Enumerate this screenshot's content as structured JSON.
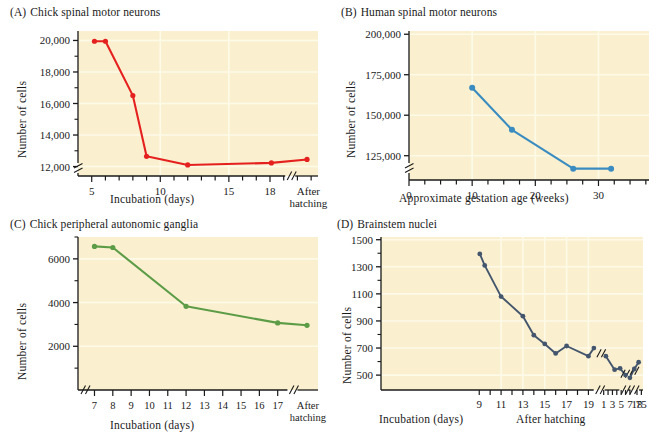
{
  "figure": {
    "background": "#ffffff",
    "plot_background": "#faf0cf",
    "grid_color": "#fdfae8",
    "axis_color": "#1a1a1a"
  },
  "chart_data": [
    {
      "id": "A",
      "type": "line",
      "tag": "(A)",
      "title": "Chick spinal motor neurons",
      "xlabel": "Incubation (days)",
      "ylabel": "Number of cells",
      "color": "#e5211f",
      "grid": true,
      "legend": "none",
      "axis_break_y": true,
      "axis_break_x": true,
      "xlim": [
        4,
        21.5
      ],
      "ylim": [
        11400,
        20600
      ],
      "xticks": [
        5,
        6,
        7,
        8,
        9,
        10,
        11,
        12,
        13,
        14,
        15,
        16,
        17,
        18,
        19,
        20,
        21
      ],
      "xticklabels": [
        "5",
        "",
        "",
        "",
        "",
        "10",
        "",
        "",
        "",
        "",
        "15",
        "",
        "",
        "18",
        "",
        "",
        ""
      ],
      "x_end_label": [
        "After",
        "hatching"
      ],
      "yticks": [
        12000,
        14000,
        16000,
        18000,
        20000
      ],
      "yticklabels": [
        "12,000",
        "14,000",
        "16,000",
        "18,000",
        "20,000"
      ],
      "x": [
        5.2,
        6.0,
        8.0,
        9.0,
        12.0,
        18.1,
        20.7
      ],
      "y": [
        19950,
        19950,
        16500,
        12650,
        12100,
        12230,
        12450
      ]
    },
    {
      "id": "B",
      "type": "line",
      "tag": "(B)",
      "title": "Human spinal motor neurons",
      "xlabel": "Approximate gestation age (weeks)",
      "ylabel": "Number of cells",
      "color": "#3a8cc0",
      "grid": true,
      "legend": "none",
      "axis_break_y": true,
      "axis_break_x": false,
      "xlim": [
        0,
        38
      ],
      "ylim": [
        110000,
        202000
      ],
      "xticks": [
        0,
        2.5,
        5,
        7.5,
        10,
        12.5,
        15,
        17.5,
        20,
        22.5,
        25,
        27.5,
        30,
        32.5,
        35,
        37.5
      ],
      "xticklabels": [
        "0",
        "",
        "",
        "",
        "10",
        "",
        "",
        "",
        "20",
        "",
        "",
        "",
        "30",
        "",
        "",
        ""
      ],
      "yticks": [
        125000,
        150000,
        175000,
        200000
      ],
      "yticklabels": [
        "125,000",
        "150,000",
        "175,000",
        "200,000"
      ],
      "x": [
        10,
        16.3,
        26,
        32
      ],
      "y": [
        167000,
        141000,
        117000,
        117000
      ]
    },
    {
      "id": "C",
      "type": "line",
      "tag": "(C)",
      "title": "Chick peripheral autonomic ganglia",
      "xlabel": "Incubation (days)",
      "ylabel": "Number of cells",
      "color": "#5d9c47",
      "grid": true,
      "legend": "none",
      "axis_break_y": false,
      "axis_break_x": true,
      "xlim": [
        6.1,
        19.2
      ],
      "ylim": [
        0,
        7000
      ],
      "xticks": [
        7,
        8,
        9,
        10,
        11,
        12,
        13,
        14,
        15,
        16,
        17
      ],
      "xticklabels": [
        "7",
        "8",
        "9",
        "10",
        "11",
        "12",
        "13",
        "14",
        "15",
        "16",
        "17"
      ],
      "x_end_label": [
        "After",
        "hatching"
      ],
      "yticks": [
        2000,
        4000,
        6000
      ],
      "yticklabels": [
        "2000",
        "4000",
        "6000"
      ],
      "x": [
        7,
        8,
        12,
        17,
        18.6
      ],
      "y": [
        6570,
        6520,
        3830,
        3070,
        2960
      ]
    },
    {
      "id": "D",
      "type": "line",
      "tag": "(D)",
      "title": "Brainstem nuclei",
      "xlabel": "Incubation (days)",
      "xlabel2": "After hatching",
      "ylabel": "Number of cells",
      "color": "#44566e",
      "grid": true,
      "legend": "none",
      "axis_break_y": false,
      "axis_break_x": true,
      "xlim": [
        0,
        24
      ],
      "ylim": [
        390,
        1520
      ],
      "xticks_incubation": [
        9,
        10,
        11,
        12,
        13,
        14,
        15,
        16,
        17,
        18,
        19
      ],
      "xticklabels_incubation": [
        "9",
        "",
        "11",
        "",
        "13",
        "",
        "15",
        "",
        "17",
        "",
        "19"
      ],
      "xticks_posthatch": [
        1,
        2,
        3,
        4,
        5,
        6,
        7,
        18,
        75
      ],
      "xticklabels_posthatch": [
        "1",
        "",
        "3",
        "",
        "5",
        "",
        "7",
        "18",
        "75"
      ],
      "yticks": [
        500,
        700,
        900,
        1100,
        1300,
        1500
      ],
      "yticklabels": [
        "500",
        "700",
        "900",
        "1100",
        "1300",
        "1500"
      ],
      "x": [
        9.05,
        9.5,
        11,
        13,
        14,
        15,
        16,
        17,
        19,
        19.5,
        20.6,
        21.4,
        21.9,
        22.4,
        22.8,
        23.2,
        23.6
      ],
      "y": [
        1395,
        1310,
        1080,
        935,
        795,
        730,
        660,
        715,
        640,
        700,
        640,
        540,
        550,
        500,
        480,
        545,
        595
      ],
      "segments": [
        {
          "from": 0,
          "to": 9
        },
        {
          "from": 10,
          "to": 13
        },
        {
          "from": 14,
          "to": 16
        }
      ]
    }
  ]
}
